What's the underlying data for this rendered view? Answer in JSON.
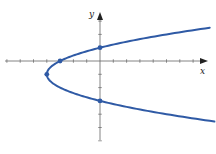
{
  "chart_data": {
    "type": "line",
    "title": "",
    "xlabel": "x",
    "ylabel": "y",
    "equation_shape": "parabola opening right, vertex (-4,-1)",
    "xlim": [
      -7.2,
      8.3
    ],
    "ylim": [
      -6.5,
      4.3
    ],
    "tick_spacing": 1,
    "grid": false,
    "curve": {
      "color": "#2f5aa5",
      "points_hint": "x = (y+1)^2 - 4"
    },
    "marked_points": [
      {
        "x": -4,
        "y": -1,
        "label": "vertex"
      },
      {
        "x": -3,
        "y": 0,
        "label": "x-intercept"
      },
      {
        "x": 0,
        "y": 1,
        "label": "y-intercept"
      },
      {
        "x": 0,
        "y": -3,
        "label": "y-intercept"
      }
    ]
  },
  "labels": {
    "x_axis": "x",
    "y_axis": "y"
  },
  "colors": {
    "curve": "#2f5aa5",
    "axis": "#555555"
  }
}
